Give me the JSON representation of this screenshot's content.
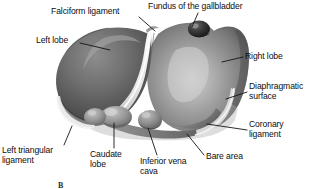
{
  "figure": {
    "view": "anterior (diaphragmatic) surface",
    "style": "grayscale medical illustration",
    "width": 317,
    "height": 189,
    "background_color": "#ffffff",
    "caption": "B"
  },
  "palette": {
    "ink": "#0d0d0d",
    "leader_line": "#1a1a1a",
    "organ_dark": "#4e4e4e",
    "organ_mid": "#7d7d7d",
    "organ_light": "#b9b9b9",
    "organ_highlight": "#d8d8d8",
    "ligament_white": "#f2f2f2",
    "shadow": "#3a3a3a",
    "gallbladder_dark": "#2a2a2a"
  },
  "labels": [
    {
      "id": "falciform-ligament",
      "text": "Falciform ligament",
      "lines": [
        "Falciform ligament"
      ],
      "x": 51,
      "y": 7,
      "align": "left",
      "leader": {
        "x1": 139,
        "y1": 17,
        "x2": 155,
        "y2": 31
      }
    },
    {
      "id": "fundus-of-the-gallbladder",
      "text": "Fundus of the gallbladder",
      "lines": [
        "Fundus of the gallbladder"
      ],
      "x": 148,
      "y": 2,
      "align": "left",
      "leader": {
        "x1": 198,
        "y1": 13,
        "x2": 192,
        "y2": 27
      }
    },
    {
      "id": "left-lobe",
      "text": "Left lobe",
      "lines": [
        "Left lobe"
      ],
      "x": 36,
      "y": 36,
      "align": "left",
      "leader": {
        "x1": 80,
        "y1": 43,
        "x2": 110,
        "y2": 50
      }
    },
    {
      "id": "right-lobe",
      "text": "Right lobe",
      "lines": [
        "Right lobe"
      ],
      "x": 245,
      "y": 52,
      "align": "left",
      "leader": {
        "x1": 243,
        "y1": 57,
        "x2": 222,
        "y2": 62
      }
    },
    {
      "id": "diaphragmatic-surface",
      "text": "Diaphragmatic surface",
      "lines": [
        "Diaphragmatic",
        "surface"
      ],
      "x": 249,
      "y": 82,
      "align": "left",
      "leader": {
        "x1": 247,
        "y1": 92,
        "x2": 226,
        "y2": 99
      }
    },
    {
      "id": "coronary-ligament",
      "text": "Coronary ligament",
      "lines": [
        "Coronary",
        "ligament"
      ],
      "x": 249,
      "y": 120,
      "align": "left",
      "leader": {
        "x1": 247,
        "y1": 130,
        "x2": 207,
        "y2": 124
      }
    },
    {
      "id": "left-triangular-ligament",
      "text": "Left triangular ligament",
      "lines": [
        "Left triangular",
        "ligament"
      ],
      "x": 2,
      "y": 146,
      "align": "left",
      "leader": {
        "x1": 64,
        "y1": 145,
        "x2": 72,
        "y2": 126
      }
    },
    {
      "id": "caudate-lobe",
      "text": "Caudate lobe",
      "lines": [
        "Caudate",
        "lobe"
      ],
      "x": 90,
      "y": 150,
      "align": "left",
      "leader": {
        "x1": 114,
        "y1": 148,
        "x2": 114,
        "y2": 123
      }
    },
    {
      "id": "inferior-vena-cava",
      "text": "Inferior vena cava",
      "lines": [
        "Inferior vena",
        "cava"
      ],
      "x": 140,
      "y": 157,
      "align": "left",
      "leader": {
        "x1": 157,
        "y1": 155,
        "x2": 148,
        "y2": 128
      }
    },
    {
      "id": "bare-area",
      "text": "Bare area",
      "lines": [
        "Bare area"
      ],
      "x": 206,
      "y": 152,
      "align": "left",
      "leader": {
        "x1": 204,
        "y1": 155,
        "x2": 187,
        "y2": 134
      }
    }
  ]
}
